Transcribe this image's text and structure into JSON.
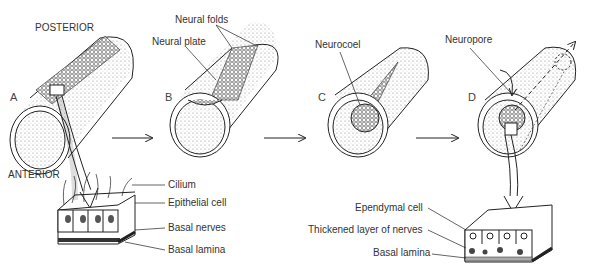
{
  "diagram": {
    "orientation": {
      "posterior": "POSTERIOR",
      "anterior": "ANTERIOR"
    },
    "stages": [
      {
        "letter": "A",
        "labels": []
      },
      {
        "letter": "B",
        "labels": [
          "Neural folds",
          "Neural plate"
        ]
      },
      {
        "letter": "C",
        "labels": [
          "Neurocoel"
        ]
      },
      {
        "letter": "D",
        "labels": [
          "Neuropore"
        ]
      }
    ],
    "detail_left": {
      "labels": [
        "Cilium",
        "Epithelial cell",
        "Basal nerves",
        "Basal lamina"
      ]
    },
    "detail_right": {
      "labels": [
        "Ependymal cell",
        "Thickened layer of nerves",
        "Basal lamina"
      ]
    },
    "colors": {
      "line": "#222222",
      "stipple": "#888888",
      "text": "#333333"
    }
  }
}
